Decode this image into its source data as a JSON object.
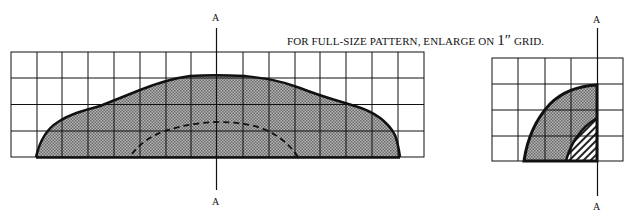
{
  "caption": {
    "text_before": "FOR FULL-SIZE PATTERN, ENLARGE ON ",
    "size": "1″",
    "text_after": " GRID."
  },
  "large_pattern": {
    "axis_label_top": "A",
    "axis_label_bottom": "A",
    "grid": {
      "columns": 16,
      "rows": 4,
      "cell_size_px": 26
    },
    "fill_style": "crosshatch-gray",
    "inner_outline": "dashed"
  },
  "small_pattern": {
    "axis_label_top": "A",
    "axis_label_bottom": "A",
    "grid": {
      "columns": 5,
      "rows": 4,
      "cell_size_px": 26
    },
    "outer_fill_style": "crosshatch-gray",
    "inner_fill_style": "diagonal-hatch"
  },
  "colors": {
    "line": "#111111",
    "fill": "#9a9a9a",
    "background": "#ffffff"
  }
}
